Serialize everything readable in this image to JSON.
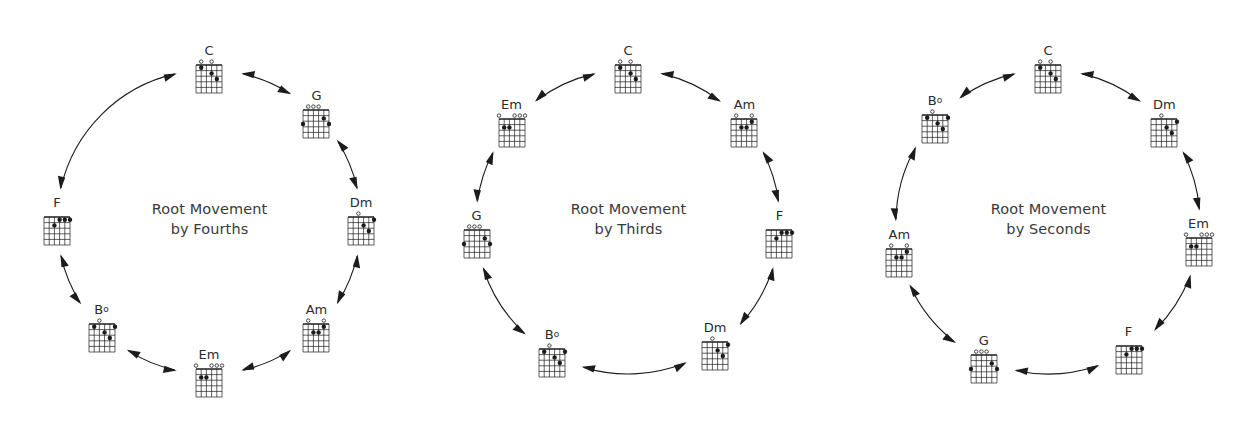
{
  "figure": {
    "title_prefix": "Root Movement",
    "background": "#ffffff",
    "ink": "#1c1c1c",
    "text_color": "#3a3a3a"
  },
  "panels": [
    {
      "id": "fourths",
      "caption_line1": "Root Movement",
      "caption_line2": "by Fourths",
      "caption_x": 210,
      "caption_y": 200,
      "center": {
        "x": 209,
        "y": 222
      },
      "radius": 152,
      "nodes": [
        {
          "name": "C",
          "label": "C",
          "dim": false,
          "angle": -90,
          "label_pos": "top",
          "chord": "C"
        },
        {
          "name": "G",
          "label": "G",
          "dim": false,
          "angle": -45,
          "label_pos": "top",
          "chord": "G"
        },
        {
          "name": "Dm",
          "label": "Dm",
          "dim": false,
          "angle": 0,
          "label_pos": "top",
          "chord": "Dm"
        },
        {
          "name": "Am",
          "label": "Am",
          "dim": false,
          "angle": 45,
          "label_pos": "top",
          "chord": "Am"
        },
        {
          "name": "Em",
          "label": "Em",
          "dim": false,
          "angle": 90,
          "label_pos": "top",
          "chord": "Em"
        },
        {
          "name": "Bdim",
          "label": "B",
          "dim": true,
          "angle": 135,
          "label_pos": "top",
          "chord": "Bdim"
        },
        {
          "name": "F",
          "label": "F",
          "dim": false,
          "angle": 180,
          "label_pos": "top",
          "chord": "F"
        },
        {
          "name": "Cend",
          "label": "",
          "dim": false,
          "angle": -135,
          "label_pos": "top",
          "chord": null
        }
      ],
      "sequence": [
        "C",
        "G",
        "Dm",
        "Am",
        "Em",
        "Bdim",
        "F",
        "C"
      ]
    },
    {
      "id": "thirds",
      "caption_line1": "Root Movement",
      "caption_line2": "by Thirds",
      "caption_x": 210,
      "caption_y": 200,
      "center": {
        "x": 209,
        "y": 222
      },
      "radius": 152,
      "nodes": [
        {
          "name": "C",
          "label": "C",
          "dim": false,
          "angle": -90,
          "label_pos": "top",
          "chord": "C"
        },
        {
          "name": "Am",
          "label": "Am",
          "dim": false,
          "angle": -40,
          "label_pos": "top",
          "chord": "Am"
        },
        {
          "name": "F",
          "label": "F",
          "dim": false,
          "angle": 5,
          "label_pos": "top",
          "chord": "F"
        },
        {
          "name": "Dm",
          "label": "Dm",
          "dim": false,
          "angle": 55,
          "label_pos": "top",
          "chord": "Dm"
        },
        {
          "name": "Bdim",
          "label": "B",
          "dim": true,
          "angle": 120,
          "label_pos": "top",
          "chord": "Bdim"
        },
        {
          "name": "G",
          "label": "G",
          "dim": false,
          "angle": 175,
          "label_pos": "top",
          "chord": "G"
        },
        {
          "name": "Em",
          "label": "Em",
          "dim": false,
          "angle": -140,
          "label_pos": "top",
          "chord": "Em"
        }
      ],
      "sequence": [
        "C",
        "Am",
        "F",
        "Dm",
        "Bdim",
        "G",
        "Em",
        "C"
      ]
    },
    {
      "id": "seconds",
      "caption_line1": "Root Movement",
      "caption_line2": "by Seconds",
      "caption_x": 212,
      "caption_y": 200,
      "center": {
        "x": 209,
        "y": 222
      },
      "radius": 152,
      "nodes": [
        {
          "name": "C",
          "label": "C",
          "dim": false,
          "angle": -90,
          "label_pos": "top",
          "chord": "C"
        },
        {
          "name": "Dm",
          "label": "Dm",
          "dim": false,
          "angle": -40,
          "label_pos": "top",
          "chord": "Dm"
        },
        {
          "name": "Em",
          "label": "Em",
          "dim": false,
          "angle": 8,
          "label_pos": "top",
          "chord": "Em"
        },
        {
          "name": "F",
          "label": "F",
          "dim": false,
          "angle": 58,
          "label_pos": "top",
          "chord": "F"
        },
        {
          "name": "G",
          "label": "G",
          "dim": false,
          "angle": 115,
          "label_pos": "top",
          "chord": "G"
        },
        {
          "name": "Am",
          "label": "Am",
          "dim": false,
          "angle": 168,
          "label_pos": "top",
          "chord": "Am"
        },
        {
          "name": "Bdim",
          "label": "B",
          "dim": true,
          "angle": -138,
          "label_pos": "top",
          "chord": "Bdim"
        }
      ],
      "sequence": [
        "C",
        "Dm",
        "Em",
        "F",
        "G",
        "Am",
        "Bdim",
        "C"
      ]
    }
  ],
  "chord_shapes": {
    "C": {
      "name": "C major",
      "strings": 6,
      "frets": 5,
      "open": [
        1,
        3
      ],
      "muted": [],
      "dots": [
        {
          "string": 1,
          "fret": 1
        },
        {
          "string": 3,
          "fret": 2
        },
        {
          "string": 4,
          "fret": 3
        }
      ]
    },
    "G": {
      "name": "G major",
      "strings": 6,
      "frets": 5,
      "open": [
        1,
        2,
        3
      ],
      "muted": [],
      "dots": [
        {
          "string": 0,
          "fret": 3
        },
        {
          "string": 4,
          "fret": 2
        },
        {
          "string": 5,
          "fret": 3
        }
      ]
    },
    "Dm": {
      "name": "D minor",
      "strings": 6,
      "frets": 5,
      "open": [
        2
      ],
      "muted": [],
      "dots": [
        {
          "string": 3,
          "fret": 2
        },
        {
          "string": 4,
          "fret": 3
        },
        {
          "string": 5,
          "fret": 1
        }
      ]
    },
    "Am": {
      "name": "A minor",
      "strings": 6,
      "frets": 5,
      "open": [
        1,
        4
      ],
      "muted": [],
      "dots": [
        {
          "string": 2,
          "fret": 2
        },
        {
          "string": 3,
          "fret": 2
        },
        {
          "string": 4,
          "fret": 1
        }
      ]
    },
    "Em": {
      "name": "E minor",
      "strings": 6,
      "frets": 5,
      "open": [
        0,
        3,
        4,
        5
      ],
      "muted": [],
      "dots": [
        {
          "string": 1,
          "fret": 2
        },
        {
          "string": 2,
          "fret": 2
        }
      ]
    },
    "Bdim": {
      "name": "B diminished",
      "strings": 6,
      "frets": 5,
      "open": [
        2
      ],
      "muted": [],
      "dots": [
        {
          "string": 1,
          "fret": 1
        },
        {
          "string": 3,
          "fret": 2
        },
        {
          "string": 4,
          "fret": 3
        },
        {
          "string": 5,
          "fret": 1
        }
      ]
    },
    "F": {
      "name": "F major",
      "strings": 6,
      "frets": 5,
      "open": [],
      "muted": [],
      "dots": [
        {
          "string": 2,
          "fret": 2
        },
        {
          "string": 3,
          "fret": 1
        },
        {
          "string": 4,
          "fret": 1
        },
        {
          "string": 5,
          "fret": 1
        }
      ]
    }
  },
  "chord_symbols": {
    "dim_glyph": "o"
  }
}
